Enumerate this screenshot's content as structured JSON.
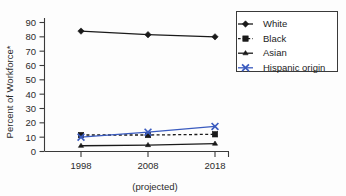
{
  "chart_data": {
    "type": "line",
    "title": "",
    "subtitle": "",
    "xlabel": "(projected)",
    "ylabel": "Percent of Workforce*",
    "x": [
      1998,
      2008,
      2018
    ],
    "categories": [
      "1998",
      "2008",
      "2018"
    ],
    "xticklabels": [
      "1998",
      "2008",
      "2018"
    ],
    "yticklabels": [
      "0",
      "10",
      "20",
      "30",
      "40",
      "50",
      "60",
      "70",
      "80",
      "90"
    ],
    "ylim": [
      0,
      90
    ],
    "yticks": [
      0,
      10,
      20,
      30,
      40,
      50,
      60,
      70,
      80,
      90
    ],
    "grid": false,
    "legend_position": "top-right",
    "series": [
      {
        "name": "White",
        "values": [
          84,
          81.5,
          80
        ],
        "color": "#1a1a1a",
        "marker": "diamond",
        "dash": "solid"
      },
      {
        "name": "Black",
        "values": [
          11.5,
          11.5,
          12
        ],
        "color": "#1a1a1a",
        "marker": "square",
        "dash": "dashed"
      },
      {
        "name": "Asian",
        "values": [
          4,
          4.5,
          5.5
        ],
        "color": "#1a1a1a",
        "marker": "dash",
        "dash": "solid"
      },
      {
        "name": "Hispanic origin",
        "values": [
          10,
          13.5,
          17.5
        ],
        "color": "#3a5bbf",
        "marker": "cross",
        "dash": "solid"
      }
    ]
  },
  "legend": {
    "entries": [
      "White",
      "Black",
      "Asian",
      "Hispanic origin"
    ]
  },
  "axes": {
    "y_title": "Percent of Workforce*",
    "x_caption": "(projected)"
  }
}
